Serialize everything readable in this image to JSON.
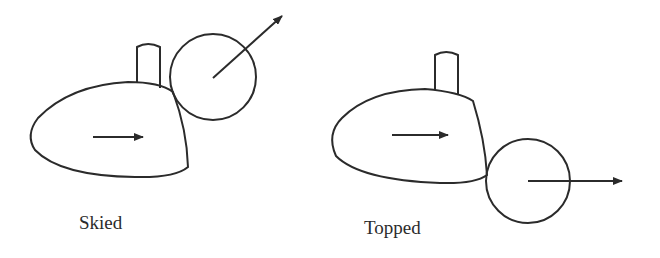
{
  "figures": [
    {
      "id": "skied",
      "caption": "Skied",
      "description": "Club head strikes ball with top edge; ball travels upward"
    },
    {
      "id": "topped",
      "caption": "Topped",
      "description": "Club head strikes ball with bottom edge; ball travels horizontally"
    }
  ],
  "colors": {
    "stroke": "#2b2b2b",
    "background": "#ffffff"
  }
}
